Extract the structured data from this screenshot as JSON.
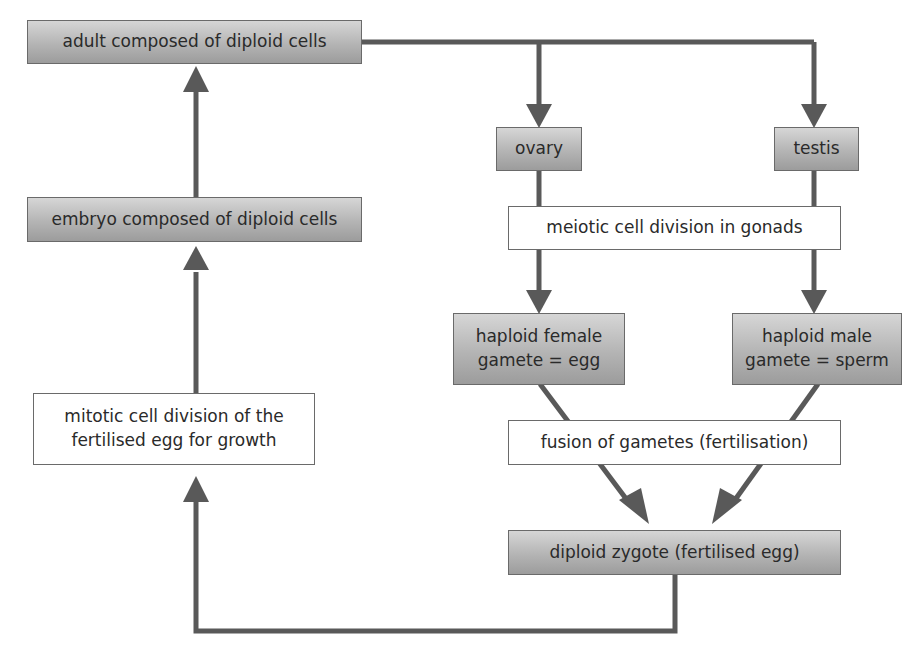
{
  "diagram": {
    "type": "flowchart",
    "colors": {
      "arrow": "#595959",
      "shaded_box_top": "#d6d6d6",
      "shaded_box_bottom": "#9c9c9c",
      "plain_box": "#ffffff",
      "border": "#6a6a6a"
    },
    "nodes": {
      "adult": {
        "label": "adult composed of diploid cells",
        "style": "shaded"
      },
      "embryo": {
        "label": "embryo composed of diploid cells",
        "style": "shaded"
      },
      "mitosis": {
        "label": "mitotic cell division of the\nfertilised egg for growth",
        "style": "plain"
      },
      "ovary": {
        "label": "ovary",
        "style": "shaded"
      },
      "testis": {
        "label": "testis",
        "style": "shaded"
      },
      "meiosis": {
        "label": "meiotic cell division in gonads",
        "style": "plain"
      },
      "egg": {
        "label": "haploid female\ngamete = egg",
        "style": "shaded"
      },
      "sperm": {
        "label": "haploid male\ngamete = sperm",
        "style": "shaded"
      },
      "fusion": {
        "label": "fusion of gametes (fertilisation)",
        "style": "plain"
      },
      "zygote": {
        "label": "diploid zygote (fertilised egg)",
        "style": "shaded"
      }
    },
    "edges": [
      {
        "from": "adult",
        "to": "ovary"
      },
      {
        "from": "adult",
        "to": "testis"
      },
      {
        "from": "ovary",
        "to": "egg",
        "via": "meiosis"
      },
      {
        "from": "testis",
        "to": "sperm",
        "via": "meiosis"
      },
      {
        "from": "egg",
        "to": "zygote",
        "via": "fusion"
      },
      {
        "from": "sperm",
        "to": "zygote",
        "via": "fusion"
      },
      {
        "from": "zygote",
        "to": "embryo",
        "via": "mitosis"
      },
      {
        "from": "embryo",
        "to": "adult"
      }
    ]
  }
}
